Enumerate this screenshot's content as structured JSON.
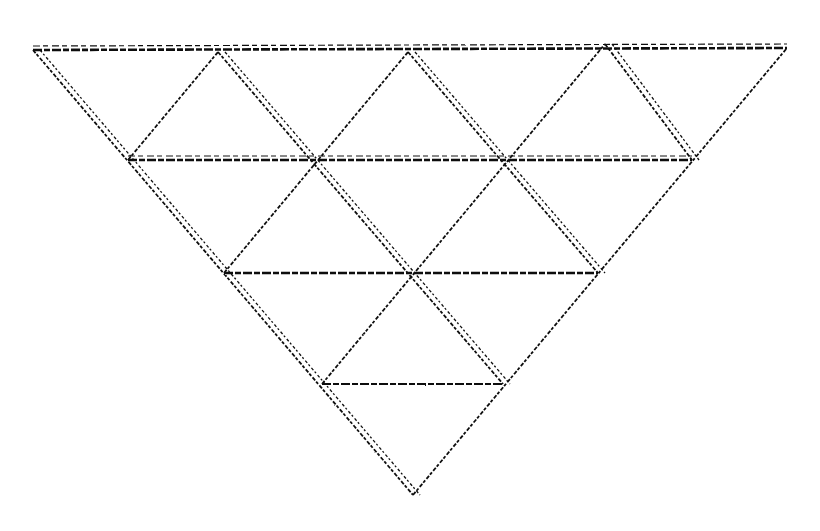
{
  "diagram": {
    "stroke_color": "#111111",
    "background_color": "#ffffff",
    "vertices": {
      "r0": [
        [
          33,
          50
        ],
        [
          218,
          52
        ],
        [
          408,
          52
        ],
        [
          605,
          44
        ],
        [
          787,
          48
        ]
      ],
      "r1": [
        [
          128,
          160
        ],
        [
          310,
          164
        ],
        [
          508,
          160
        ],
        [
          692,
          160
        ]
      ],
      "r2": [
        [
          224,
          273
        ],
        [
          412,
          275
        ],
        [
          598,
          273
        ]
      ],
      "r3": [
        [
          322,
          384
        ],
        [
          503,
          384
        ]
      ],
      "r4": [
        [
          413,
          495
        ]
      ]
    },
    "horizontal_lines": [
      {
        "from": [
          33,
          50
        ],
        "to": [
          787,
          48
        ],
        "weight": "heavy",
        "doubled": true
      },
      {
        "from": [
          128,
          160
        ],
        "to": [
          692,
          160
        ],
        "weight": "heavy",
        "doubled": true
      },
      {
        "from": [
          224,
          273
        ],
        "to": [
          598,
          273
        ],
        "weight": "heavy",
        "doubled": false
      },
      {
        "from": [
          322,
          384
        ],
        "to": [
          503,
          384
        ],
        "weight": "medium",
        "doubled": false
      }
    ],
    "descending_lines": [
      {
        "from": [
          33,
          50
        ],
        "to": [
          413,
          495
        ],
        "doubled": true
      },
      {
        "from": [
          218,
          52
        ],
        "to": [
          503,
          384
        ],
        "doubled": true
      },
      {
        "from": [
          408,
          52
        ],
        "to": [
          598,
          273
        ],
        "doubled": true
      },
      {
        "from": [
          605,
          44
        ],
        "to": [
          692,
          160
        ],
        "doubled": true
      }
    ],
    "ascending_lines": [
      {
        "from": [
          128,
          160
        ],
        "to": [
          218,
          52
        ]
      },
      {
        "from": [
          224,
          273
        ],
        "to": [
          408,
          52
        ]
      },
      {
        "from": [
          322,
          384
        ],
        "to": [
          605,
          44
        ]
      },
      {
        "from": [
          413,
          495
        ],
        "to": [
          787,
          48
        ]
      }
    ]
  }
}
